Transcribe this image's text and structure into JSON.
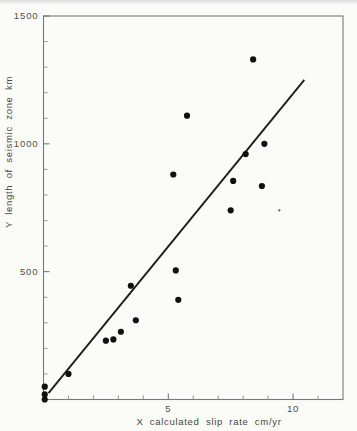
{
  "figure": {
    "kind": "scanned scatter plot, black ink on white paper",
    "title": ""
  },
  "chart_data": {
    "type": "scatter",
    "title": "",
    "xlabel": "X calculated slip rate cm/yr",
    "ylabel": "Y length of seismic zone km",
    "xlim": [
      0,
      12
    ],
    "ylim": [
      0,
      1500
    ],
    "grid": false,
    "legend": false,
    "x_labeled_ticks": [
      5,
      10
    ],
    "x_minor_tick_step": 1,
    "y_labeled_ticks": [
      500,
      1000,
      1500
    ],
    "y_minor_tick_step": 100,
    "points": [
      [
        0.05,
        0
      ],
      [
        0.05,
        20
      ],
      [
        0.05,
        50
      ],
      [
        1.0,
        100
      ],
      [
        2.5,
        230
      ],
      [
        2.8,
        235
      ],
      [
        3.1,
        265
      ],
      [
        3.5,
        445
      ],
      [
        3.7,
        310
      ],
      [
        5.2,
        880
      ],
      [
        5.3,
        505
      ],
      [
        5.4,
        390
      ],
      [
        5.75,
        1110
      ],
      [
        7.5,
        740
      ],
      [
        7.6,
        855
      ],
      [
        8.1,
        960
      ],
      [
        8.4,
        1330
      ],
      [
        8.75,
        835
      ],
      [
        8.85,
        1000
      ]
    ],
    "small_mark": [
      9.45,
      740
    ],
    "fit_line": {
      "x1": 0.2,
      "y1": 25,
      "x2": 10.45,
      "y2": 1250
    }
  },
  "colors": {
    "background": "#fbfbf8",
    "frame": "#787878",
    "tick": "#8a8a8a",
    "major_tick": "#6a6a6a",
    "point_ink": "#101010",
    "line_ink": "#1d1d1d",
    "small_mark_ink": "#555555"
  }
}
